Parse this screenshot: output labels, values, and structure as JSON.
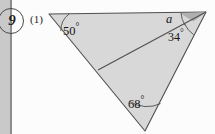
{
  "page": {
    "question_number": "9",
    "part_label": "(1)",
    "background_color": "#fcfcfc",
    "edge_strip_color": "#c9c9c9",
    "margin_rule_color": "#8d8d8d"
  },
  "figure": {
    "type": "geometry-triangle-diagram",
    "fill_color": "#d8d8d8",
    "wedge_fill_color": "#b4b4b4",
    "stroke_color": "#4f4f4f",
    "vertices": {
      "top_left": [
        49,
        14
      ],
      "top_right": [
        206,
        12
      ],
      "bottom": [
        145,
        131
      ],
      "cevian_foot": [
        98,
        70
      ]
    },
    "angles": [
      {
        "name": "angle-50",
        "value": "50",
        "unit": "°",
        "text": "50°",
        "vertex": "top_left"
      },
      {
        "name": "angle-a",
        "value": "a",
        "unit": "",
        "text": "a",
        "vertex": "top_right_upper"
      },
      {
        "name": "angle-34",
        "value": "34",
        "unit": "°",
        "text": "34°",
        "vertex": "top_right_lower"
      },
      {
        "name": "angle-68",
        "value": "68",
        "unit": "°",
        "text": "68°",
        "vertex": "bottom"
      }
    ],
    "labels": {
      "fifty": "50",
      "thirtyfour": "34",
      "sixtyeight": "68",
      "unknown": "a",
      "degree": "°"
    }
  }
}
